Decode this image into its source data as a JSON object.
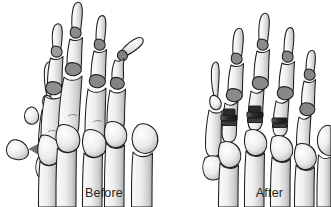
{
  "figure": {
    "background_color": "#ffffff"
  },
  "panels": [
    {
      "id": "before",
      "caption": "Before",
      "description": "Foot skeleton showing bunion prominence on first metatarsal head and deformed, angulated lesser toes",
      "arrow": {
        "name": "resection-arrow",
        "description": "Arrow indicating removal of medial eminence bone fragment",
        "direction": "down-left"
      },
      "removed_fragment": {
        "name": "bone-fragment",
        "description": "Excised medial eminence wedge of bone"
      }
    },
    {
      "id": "after",
      "caption": "After",
      "description": "Corrected foot skeleton with straightened toes and joint implants in place",
      "implants": [
        {
          "name": "joint-implant-2nd-ray"
        },
        {
          "name": "joint-implant-3rd-ray"
        },
        {
          "name": "joint-implant-4th-ray"
        }
      ]
    }
  ],
  "colors": {
    "bone_fill_light": "#f7f7f7",
    "bone_fill_mid": "#dcdcdc",
    "bone_fill_shadow": "#b9b9b9",
    "bone_fill_deep": "#9a9a9a",
    "outline": "#1e1e1e",
    "joint_line": "#2b2b2b",
    "implant_dark": "#2a2a2a",
    "implant_mid": "#4f4f4f",
    "caption_text": "#262626",
    "background": "#ffffff"
  },
  "captions": {
    "before_label": "Before",
    "after_label": "After"
  }
}
